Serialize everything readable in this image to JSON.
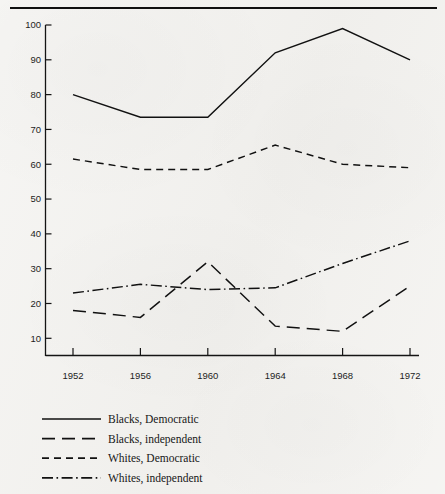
{
  "figure": {
    "background_color": "#f3f2ef",
    "ink_color": "#111111",
    "top_rule": {
      "name": "top-rule",
      "x1": 10,
      "x2": 437,
      "y": 8
    }
  },
  "chart_data": {
    "type": "line",
    "title": "",
    "subtitle": "",
    "xlabel": "",
    "ylabel": "",
    "categories": [
      "1952",
      "1956",
      "1960",
      "1964",
      "1968",
      "1972"
    ],
    "x": [
      1952,
      1956,
      1960,
      1964,
      1968,
      1972
    ],
    "xlim": [
      1952,
      1972
    ],
    "ylim": [
      0,
      100
    ],
    "yticks": [
      10,
      20,
      30,
      40,
      50,
      60,
      70,
      80,
      90,
      100
    ],
    "ytick_labels": [
      "10",
      "20",
      "30",
      "40",
      "50",
      "60",
      "70",
      "80",
      "90",
      "100"
    ],
    "xticks": [
      1952,
      1956,
      1960,
      1964,
      1968,
      1972
    ],
    "xtick_labels": [
      "1952",
      "1956",
      "1960",
      "1964",
      "1968",
      "1972"
    ],
    "grid": false,
    "legend_position": "below-left",
    "series": [
      {
        "name": "Blacks, Democratic",
        "style": "solid",
        "dasharray": "none",
        "values": [
          80,
          73.5,
          73.5,
          92,
          99,
          90
        ]
      },
      {
        "name": "Blacks, independent",
        "style": "long-dash",
        "dasharray": "13 7",
        "values": [
          18,
          16,
          32,
          13.5,
          12,
          25
        ]
      },
      {
        "name": "Whites, Democratic",
        "style": "short-dash",
        "dasharray": "7 5",
        "values": [
          61.5,
          58.5,
          58.5,
          65.5,
          60,
          59
        ]
      },
      {
        "name": "Whites, independent",
        "style": "dash-dot",
        "dasharray": "11 3.5 1.6 3.5",
        "values": [
          23,
          25.5,
          24,
          24.5,
          31.5,
          38
        ]
      }
    ]
  },
  "legend": {
    "name": "chart-legend",
    "entries": [
      {
        "label": "Blacks, Democratic",
        "dasharray": "none"
      },
      {
        "label": "Blacks, independent",
        "dasharray": "13 7"
      },
      {
        "label": "Whites, Democratic",
        "dasharray": "7 5"
      },
      {
        "label": "Whites, independent",
        "dasharray": "11 3.5 1.6 3.5"
      }
    ]
  }
}
